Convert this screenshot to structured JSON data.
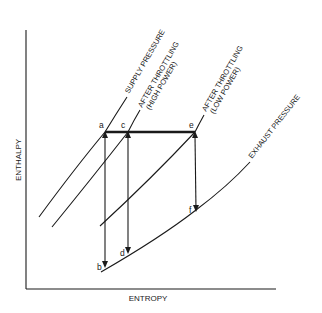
{
  "diagram": {
    "type": "enthalpy-entropy (Mollier) diagram — steam throttling",
    "axes": {
      "x_label": "ENTROPY",
      "y_label": "ENTHALPY"
    },
    "curves": [
      {
        "id": "supply",
        "label": "SUPPLY PRESSURE"
      },
      {
        "id": "high_power",
        "label_line1": "AFTER THROTTLING",
        "label_line2": "(HIGH POWER)"
      },
      {
        "id": "low_power",
        "label_line1": "AFTER THROTTLING",
        "label_line2": "(LOW POWER)"
      },
      {
        "id": "exhaust",
        "label": "EXHAUST PRESSURE"
      }
    ],
    "points": {
      "a": "a",
      "b": "b",
      "c": "c",
      "d": "d",
      "e": "e",
      "f": "f"
    },
    "processes": [
      {
        "from": "a",
        "to": "c",
        "kind": "throttling (constant enthalpy)"
      },
      {
        "from": "c",
        "to": "e",
        "kind": "throttling (constant enthalpy)"
      },
      {
        "from": "a",
        "to": "b",
        "kind": "isentropic expansion"
      },
      {
        "from": "c",
        "to": "d",
        "kind": "isentropic expansion"
      },
      {
        "from": "e",
        "to": "f",
        "kind": "isentropic expansion"
      }
    ],
    "colors": {
      "ink": "#1a1a1a",
      "background": "#ffffff"
    }
  }
}
